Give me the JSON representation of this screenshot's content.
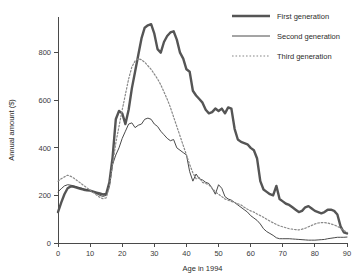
{
  "chart_data": {
    "type": "line",
    "title": "",
    "xlabel": "Age in 1994",
    "ylabel": "Annual amount ($)",
    "xlim": [
      0,
      90
    ],
    "ylim": [
      0,
      950
    ],
    "xticks": [
      0,
      10,
      20,
      30,
      40,
      50,
      60,
      70,
      80,
      90
    ],
    "yticks": [
      0,
      200,
      400,
      600,
      800
    ],
    "xtick_labels": [
      "0",
      "10",
      "20",
      "30",
      "40",
      "50",
      "60",
      "70",
      "80",
      "90"
    ],
    "ytick_labels": [
      "0",
      "200",
      "400",
      "600",
      "800"
    ],
    "grid": false,
    "legend_position": "top-right",
    "x": [
      0,
      1,
      2,
      3,
      4,
      5,
      6,
      7,
      8,
      9,
      10,
      11,
      12,
      13,
      14,
      15,
      16,
      17,
      18,
      19,
      20,
      21,
      22,
      23,
      24,
      25,
      26,
      27,
      28,
      29,
      30,
      31,
      32,
      33,
      34,
      35,
      36,
      37,
      38,
      39,
      40,
      41,
      42,
      43,
      44,
      45,
      46,
      47,
      48,
      49,
      50,
      51,
      52,
      53,
      54,
      55,
      56,
      57,
      58,
      59,
      60,
      61,
      62,
      63,
      64,
      65,
      66,
      67,
      68,
      69,
      70,
      71,
      72,
      73,
      74,
      75,
      76,
      77,
      78,
      79,
      80,
      81,
      82,
      83,
      84,
      85,
      86,
      87,
      88,
      89,
      90
    ],
    "series": [
      {
        "name": "First generation",
        "color": "#555555",
        "style": "solid",
        "width": 2.4,
        "values": [
          130,
          170,
          205,
          230,
          238,
          236,
          232,
          228,
          224,
          222,
          220,
          216,
          212,
          208,
          204,
          206,
          255,
          360,
          520,
          555,
          545,
          500,
          560,
          650,
          720,
          790,
          860,
          905,
          915,
          920,
          880,
          815,
          800,
          845,
          870,
          885,
          890,
          855,
          800,
          775,
          730,
          720,
          640,
          620,
          605,
          590,
          560,
          545,
          550,
          565,
          555,
          565,
          545,
          570,
          565,
          480,
          435,
          425,
          420,
          415,
          400,
          390,
          355,
          260,
          225,
          215,
          205,
          200,
          240,
          185,
          175,
          165,
          160,
          150,
          140,
          130,
          135,
          150,
          155,
          145,
          135,
          130,
          125,
          130,
          140,
          140,
          135,
          120,
          70,
          45,
          40
        ]
      },
      {
        "name": "Second generation",
        "color": "#4a4a4a",
        "style": "solid",
        "width": 1.0,
        "values": [
          215,
          228,
          240,
          245,
          243,
          240,
          236,
          232,
          228,
          224,
          220,
          214,
          208,
          200,
          196,
          200,
          240,
          330,
          370,
          400,
          440,
          470,
          500,
          505,
          485,
          495,
          500,
          520,
          525,
          520,
          500,
          490,
          470,
          455,
          440,
          430,
          435,
          400,
          390,
          380,
          370,
          300,
          260,
          290,
          270,
          265,
          255,
          250,
          230,
          205,
          245,
          230,
          195,
          185,
          180,
          170,
          160,
          150,
          140,
          130,
          115,
          105,
          95,
          80,
          60,
          48,
          40,
          32,
          22,
          18,
          18,
          18,
          18,
          17,
          16,
          15,
          14,
          13,
          12,
          12,
          12,
          13,
          14,
          15,
          18,
          20,
          22,
          24,
          24,
          24,
          25
        ]
      },
      {
        "name": "Third generation",
        "color": "#888888",
        "style": "dotted",
        "width": 1.2,
        "values": [
          260,
          270,
          278,
          285,
          280,
          272,
          262,
          252,
          242,
          232,
          222,
          212,
          202,
          192,
          186,
          190,
          235,
          330,
          420,
          490,
          560,
          625,
          690,
          740,
          765,
          775,
          770,
          760,
          745,
          730,
          710,
          690,
          665,
          635,
          605,
          570,
          530,
          490,
          450,
          410,
          370,
          330,
          295,
          270,
          275,
          255,
          250,
          245,
          230,
          215,
          205,
          195,
          185,
          180,
          175,
          170,
          165,
          160,
          150,
          142,
          135,
          130,
          122,
          115,
          108,
          100,
          92,
          85,
          78,
          72,
          68,
          64,
          60,
          58,
          56,
          55,
          58,
          62,
          68,
          74,
          80,
          84,
          86,
          86,
          84,
          80,
          76,
          70,
          62,
          52,
          45
        ]
      }
    ]
  },
  "legend": {
    "items": [
      {
        "label": "First generation"
      },
      {
        "label": "Second generation"
      },
      {
        "label": "Third generation"
      }
    ]
  }
}
